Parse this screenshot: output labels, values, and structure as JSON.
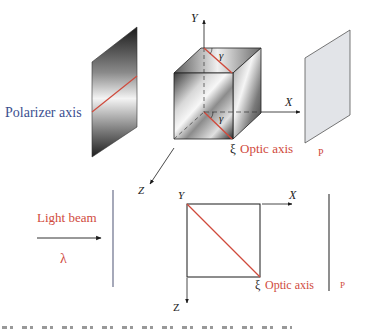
{
  "figure": {
    "top_panel": {
      "polarizer_label": "Polarizer axis",
      "axis_y": "Y",
      "axis_x": "X",
      "axis_z": "Z",
      "angle_top": "γ",
      "angle_bottom": "γ",
      "optic_axis_symbol": "ξ",
      "optic_axis_label": "Optic axis",
      "analyzer_label": "P"
    },
    "bottom_panel": {
      "beam_label": "Light beam",
      "wavelength_symbol": "λ",
      "axis_y": "Y",
      "axis_x": "X",
      "axis_z": "Z",
      "optic_axis_symbol": "ξ",
      "optic_axis_label": "Optic axis",
      "analyzer_label": "P"
    },
    "colors": {
      "optic_axis": "#d04a3c",
      "polarizer_text": "#3b4f8f",
      "analyzer_fill": "#e2e4e8",
      "line": "#222222",
      "polarizer_line": "#6a6f8a"
    }
  }
}
